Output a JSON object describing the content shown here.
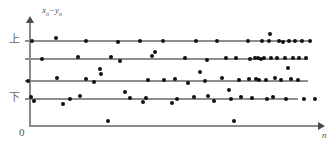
{
  "figure": {
    "title": "",
    "axis_labels": {
      "y_axis": "x",
      "y_axis_sub1": "n",
      "y_axis_minus": "−",
      "y_axis_var2": "y",
      "y_axis_sub2": "n",
      "x_axis": "n",
      "origin": "0"
    },
    "category_labels": {
      "upper": "上",
      "lower": "下"
    },
    "colors": {
      "point": "#111111",
      "level_line": "#8d8d8d",
      "axis": "#8a8a8a",
      "label_text": "#5d5d5d",
      "background": "#ffffff"
    }
  },
  "chart_data": {
    "type": "scatter",
    "title": "",
    "xlabel": "n",
    "ylabel": "xₙ−yₙ",
    "xlim": [
      0,
      100
    ],
    "ylim": [
      0,
      100
    ],
    "grid": false,
    "legend": null,
    "annotations": [
      {
        "text": "上",
        "x": -6,
        "y": 82,
        "meaning": "upper-control-limit-label"
      },
      {
        "text": "下",
        "x": -6,
        "y": 28,
        "meaning": "lower-control-limit-label"
      },
      {
        "text": "0",
        "x": -4,
        "y": -6,
        "meaning": "origin-label"
      }
    ],
    "reference_lines": [
      {
        "name": "upper-limit",
        "y": 82,
        "x_start": 1.5,
        "x_end": 95.5
      },
      {
        "name": "upper-mid",
        "y": 67,
        "x_start": 1.5,
        "x_end": 95.5
      },
      {
        "name": "lower-mid",
        "y": 48,
        "x_start": 1.5,
        "x_end": 95.5
      },
      {
        "name": "lower-limit",
        "y": 28,
        "x_start": 1.5,
        "x_end": 92.0
      }
    ],
    "series": [
      {
        "name": "x_n - y_n observations",
        "marker": "filled-circle",
        "color": "#111111",
        "x": [
          1.0,
          3.5,
          5.2,
          8.5,
          12.0,
          14.5,
          17.5,
          20.5,
          23.5,
          26.5,
          29.5,
          32.5,
          36.0,
          39.0,
          42.5,
          45.5,
          48.5,
          51.0,
          53.5,
          56.5,
          59.5,
          62.5,
          65.5,
          68.5,
          70.5,
          72.5,
          74.5,
          76.0,
          77.5,
          79.0,
          80.5,
          82.0,
          83.5,
          85.0,
          86.5,
          88.0,
          89.5,
          91.0,
          92.5,
          94.0,
          95.5,
          97.0,
          10.0,
          6.0,
          21.0,
          34.0,
          43.0,
          58.0,
          63.0,
          66.0,
          69.0,
          30.5,
          40.0,
          50.5,
          54.0,
          87.0,
          93.0,
          96.0,
          84.0,
          81.0,
          78.0,
          75.0,
          73.0,
          71.0,
          67.0,
          64.0,
          61.0,
          57.0,
          55.0,
          52.0
        ],
        "y": [
          47,
          28,
          24,
          80,
          48,
          82,
          66,
          80,
          53,
          37,
          67,
          82,
          45,
          59,
          80,
          63,
          82,
          30,
          44,
          82,
          40,
          56,
          82,
          67,
          48,
          82,
          63,
          48,
          82,
          67,
          48,
          82,
          90,
          67,
          82,
          48,
          67,
          82,
          48,
          67,
          82,
          48,
          15,
          36,
          25,
          30,
          48,
          25,
          53,
          10,
          31,
          38,
          70,
          28,
          46,
          48,
          40,
          28,
          60,
          53,
          44,
          67,
          57,
          67,
          48,
          44,
          67,
          48,
          53,
          44
        ]
      }
    ],
    "points_pixel": [
      {
        "x": 28,
        "y": 81
      },
      {
        "x": 31,
        "y": 97
      },
      {
        "x": 32,
        "y": 41
      },
      {
        "x": 34,
        "y": 101
      },
      {
        "x": 42,
        "y": 59
      },
      {
        "x": 56,
        "y": 38
      },
      {
        "x": 57,
        "y": 78
      },
      {
        "x": 63,
        "y": 104
      },
      {
        "x": 70,
        "y": 99
      },
      {
        "x": 78,
        "y": 57
      },
      {
        "x": 80,
        "y": 96
      },
      {
        "x": 86,
        "y": 41
      },
      {
        "x": 86,
        "y": 79
      },
      {
        "x": 94,
        "y": 82
      },
      {
        "x": 100,
        "y": 69
      },
      {
        "x": 101,
        "y": 74
      },
      {
        "x": 108,
        "y": 121
      },
      {
        "x": 111,
        "y": 57
      },
      {
        "x": 118,
        "y": 42
      },
      {
        "x": 120,
        "y": 61
      },
      {
        "x": 125,
        "y": 92
      },
      {
        "x": 130,
        "y": 98
      },
      {
        "x": 140,
        "y": 41
      },
      {
        "x": 143,
        "y": 102
      },
      {
        "x": 146,
        "y": 98
      },
      {
        "x": 148,
        "y": 80
      },
      {
        "x": 152,
        "y": 56
      },
      {
        "x": 155,
        "y": 52
      },
      {
        "x": 163,
        "y": 41
      },
      {
        "x": 164,
        "y": 80
      },
      {
        "x": 172,
        "y": 103
      },
      {
        "x": 175,
        "y": 79
      },
      {
        "x": 177,
        "y": 99
      },
      {
        "x": 185,
        "y": 58
      },
      {
        "x": 188,
        "y": 83
      },
      {
        "x": 194,
        "y": 97
      },
      {
        "x": 196,
        "y": 41
      },
      {
        "x": 200,
        "y": 72
      },
      {
        "x": 205,
        "y": 81
      },
      {
        "x": 207,
        "y": 60
      },
      {
        "x": 208,
        "y": 96
      },
      {
        "x": 214,
        "y": 101
      },
      {
        "x": 217,
        "y": 41
      },
      {
        "x": 222,
        "y": 78
      },
      {
        "x": 226,
        "y": 58
      },
      {
        "x": 229,
        "y": 90
      },
      {
        "x": 231,
        "y": 99
      },
      {
        "x": 234,
        "y": 121
      },
      {
        "x": 236,
        "y": 58
      },
      {
        "x": 239,
        "y": 80
      },
      {
        "x": 241,
        "y": 97
      },
      {
        "x": 248,
        "y": 41
      },
      {
        "x": 249,
        "y": 79
      },
      {
        "x": 250,
        "y": 59
      },
      {
        "x": 252,
        "y": 98
      },
      {
        "x": 255,
        "y": 58
      },
      {
        "x": 256,
        "y": 79
      },
      {
        "x": 258,
        "y": 58
      },
      {
        "x": 259,
        "y": 80
      },
      {
        "x": 261,
        "y": 59
      },
      {
        "x": 262,
        "y": 41
      },
      {
        "x": 264,
        "y": 58
      },
      {
        "x": 266,
        "y": 80
      },
      {
        "x": 267,
        "y": 99
      },
      {
        "x": 269,
        "y": 41
      },
      {
        "x": 270,
        "y": 34
      },
      {
        "x": 271,
        "y": 58
      },
      {
        "x": 273,
        "y": 97
      },
      {
        "x": 275,
        "y": 78
      },
      {
        "x": 277,
        "y": 58
      },
      {
        "x": 279,
        "y": 41
      },
      {
        "x": 281,
        "y": 80
      },
      {
        "x": 283,
        "y": 42
      },
      {
        "x": 285,
        "y": 58
      },
      {
        "x": 286,
        "y": 99
      },
      {
        "x": 288,
        "y": 68
      },
      {
        "x": 289,
        "y": 41
      },
      {
        "x": 291,
        "y": 79
      },
      {
        "x": 293,
        "y": 58
      },
      {
        "x": 295,
        "y": 41
      },
      {
        "x": 298,
        "y": 80
      },
      {
        "x": 299,
        "y": 58
      },
      {
        "x": 302,
        "y": 41
      },
      {
        "x": 304,
        "y": 99
      },
      {
        "x": 306,
        "y": 58
      },
      {
        "x": 310,
        "y": 41
      },
      {
        "x": 315,
        "y": 99
      }
    ]
  }
}
